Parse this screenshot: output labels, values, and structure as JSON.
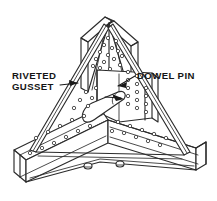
{
  "figure": {
    "background_color": "#ffffff",
    "line_color": "#2b2b2b",
    "text_color": "#151515",
    "view": "isometric perspective"
  },
  "labels": {
    "gusset": {
      "line1": "RIVETED",
      "line2": "GUSSET",
      "x": 12,
      "y": 78,
      "leader_target": "left-gusset-strap"
    },
    "dowel": {
      "line1": "DOWEL PIN",
      "x": 137,
      "y": 78,
      "leader_target": "dowel-pin-cylinder"
    }
  },
  "parts": [
    {
      "name": "vertical-channel-arm",
      "description": "upper vertical channel member with rivet rows"
    },
    {
      "name": "left-channel-arm",
      "description": "lower left channel member with rivet rows"
    },
    {
      "name": "right-channel-arm",
      "description": "lower right channel member with rivet rows"
    },
    {
      "name": "center-gusset-plate",
      "description": "central triangular riveted gusset plate"
    },
    {
      "name": "left-gusset-strap",
      "description": "diagonal riveted gusset strap, left side"
    },
    {
      "name": "right-gusset-strap",
      "description": "diagonal riveted gusset strap, right side"
    },
    {
      "name": "dowel-pin-cylinder",
      "description": "tapered cylindrical dowel pin at joint center"
    },
    {
      "name": "base-fastener-left",
      "description": "small bolt head at lower center"
    },
    {
      "name": "base-fastener-right",
      "description": "small bolt head at lower center"
    }
  ],
  "rivets": {
    "shape": "small-circle",
    "radius": 1.7,
    "groups": [
      {
        "name": "vertical-arm-rivets",
        "points": [
          [
            108,
            38
          ],
          [
            116,
            41
          ],
          [
            104,
            45
          ],
          [
            112,
            48
          ],
          [
            100,
            52
          ],
          [
            108,
            55
          ],
          [
            118,
            51
          ],
          [
            96,
            59
          ],
          [
            104,
            62
          ],
          [
            114,
            59
          ],
          [
            122,
            56
          ],
          [
            100,
            68
          ],
          [
            110,
            69
          ],
          [
            120,
            65
          ],
          [
            93,
            66
          ]
        ]
      },
      {
        "name": "center-plate-rivets",
        "points": [
          [
            128,
            72
          ],
          [
            128,
            80
          ],
          [
            128,
            88
          ],
          [
            128,
            96
          ],
          [
            128,
            104
          ],
          [
            137,
            76
          ],
          [
            137,
            84
          ],
          [
            137,
            92
          ],
          [
            137,
            100
          ],
          [
            137,
            108
          ],
          [
            146,
            88
          ],
          [
            146,
            96
          ],
          [
            146,
            104
          ],
          [
            146,
            112
          ]
        ]
      },
      {
        "name": "left-arm-rivets",
        "points": [
          [
            84,
            116
          ],
          [
            72,
            120
          ],
          [
            60,
            126
          ],
          [
            48,
            132
          ],
          [
            36,
            138
          ],
          [
            90,
            126
          ],
          [
            78,
            131
          ],
          [
            66,
            137
          ],
          [
            54,
            143
          ],
          [
            42,
            148
          ],
          [
            30,
            153
          ]
        ]
      },
      {
        "name": "right-arm-rivets",
        "points": [
          [
            118,
            122
          ],
          [
            130,
            126
          ],
          [
            142,
            130
          ],
          [
            154,
            134
          ],
          [
            124,
            133
          ],
          [
            136,
            137
          ],
          [
            148,
            141
          ],
          [
            160,
            145
          ],
          [
            112,
            131
          ],
          [
            166,
            138
          ]
        ]
      },
      {
        "name": "upper-left-plate-rivets",
        "points": [
          [
            86,
            92
          ],
          [
            92,
            98
          ],
          [
            80,
            100
          ],
          [
            88,
            106
          ],
          [
            96,
            88
          ],
          [
            74,
            108
          ]
        ]
      }
    ]
  }
}
